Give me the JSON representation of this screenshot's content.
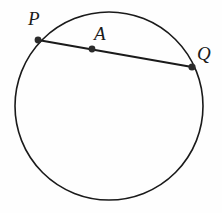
{
  "figure": {
    "background_color": "#fefefe",
    "stroke_color": "#1a1a1a",
    "width": 222,
    "height": 213
  },
  "labels": {
    "p": "P",
    "a": "A",
    "q": "Q"
  },
  "geometry": {
    "circle": {
      "name": "circle",
      "cx": 109,
      "cy": 106,
      "r": 94,
      "stroke": "#1a1a1a",
      "stroke_width": 1.6,
      "fill": "none"
    },
    "chord": {
      "name": "chord-pq",
      "x1": 38,
      "y1": 40,
      "x2": 192,
      "y2": 67,
      "stroke": "#1a1a1a",
      "stroke_width": 2.1
    },
    "points": [
      {
        "name": "point-p",
        "label": "P",
        "cx": 38,
        "cy": 40,
        "r": 3.4,
        "fill": "#2b2b2b"
      },
      {
        "name": "point-a",
        "label": "A",
        "cx": 92,
        "cy": 49,
        "r": 3.4,
        "fill": "#2b2b2b"
      },
      {
        "name": "point-q",
        "label": "Q",
        "cx": 192,
        "cy": 67,
        "r": 3.6,
        "fill": "#2b2b2b"
      }
    ]
  }
}
